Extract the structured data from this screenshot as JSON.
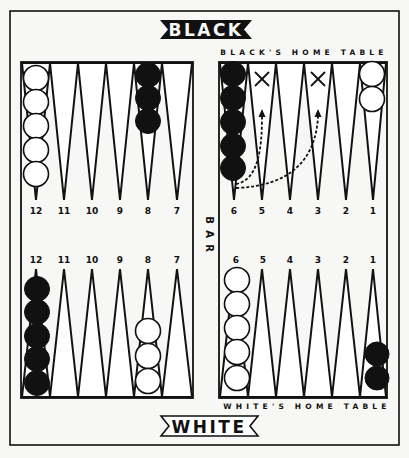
{
  "banners": {
    "top": "BLACK",
    "bottom": "WHITE"
  },
  "home_tables": {
    "top": "BLACK'S HOME TABLE",
    "bottom": "WHITE'S HOME TABLE"
  },
  "bar": {
    "label": "BAR",
    "letters": [
      "B",
      "A",
      "R"
    ]
  },
  "point_labels": {
    "top_left": [
      "12",
      "11",
      "10",
      "9",
      "8",
      "7"
    ],
    "top_right": [
      "6",
      "5",
      "4",
      "3",
      "2",
      "1"
    ],
    "bottom_left": [
      "12",
      "11",
      "10",
      "9",
      "8",
      "7"
    ],
    "bottom_right": [
      "6",
      "5",
      "4",
      "3",
      "2",
      "1"
    ]
  },
  "checkers": {
    "top_left_12": {
      "color": "white",
      "count": 5
    },
    "top_left_8": {
      "color": "black",
      "count": 3
    },
    "top_right_6": {
      "color": "black",
      "count": 5
    },
    "top_right_1": {
      "color": "white",
      "count": 2
    },
    "bottom_left_12": {
      "color": "black",
      "count": 5
    },
    "bottom_left_8": {
      "color": "white",
      "count": 3
    },
    "bottom_right_6": {
      "color": "white",
      "count": 5
    },
    "bottom_right_1": {
      "color": "black",
      "count": 2
    }
  },
  "annotations": {
    "crosses": [
      "black point 5",
      "black point 3"
    ],
    "arrows": [
      "from black 6 to black 5",
      "from black 6 to black 3"
    ]
  },
  "colors": {
    "ink": "#111111",
    "paper": "#f7f7f5"
  }
}
